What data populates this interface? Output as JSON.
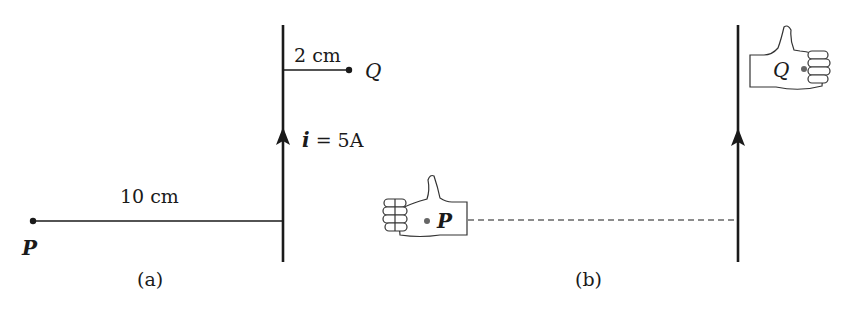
{
  "figure": {
    "panel_a": {
      "caption": "(a)",
      "wire": {
        "current_label_var": "i",
        "current_label_rest": " = 5A",
        "direction": "up"
      },
      "point_q": {
        "label": "Q",
        "distance_label": "2 cm"
      },
      "point_p": {
        "label": "P",
        "distance_label": "10 cm"
      }
    },
    "panel_b": {
      "caption": "(b)",
      "wire": {
        "direction": "up"
      },
      "hand_p": {
        "label": "P",
        "thumb": "up",
        "orientation": "fingers-left"
      },
      "hand_q": {
        "label": "Q",
        "thumb": "up",
        "orientation": "fingers-right"
      }
    },
    "colors": {
      "ink": "#1a1a1a",
      "dot_gray": "#666666",
      "background": "#ffffff"
    }
  }
}
